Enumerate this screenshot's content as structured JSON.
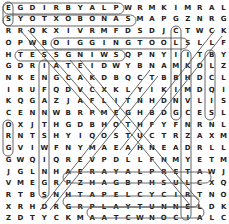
{
  "puzzle": {
    "type": "word-search",
    "rows": 19,
    "cols": 19,
    "grid": [
      "EGDIRBYALPWRMKIMRAL",
      "SYOTXOBONASMAPGZNRG",
      "RROKXIVRMFDSDJCTWCK",
      "OPWBOIGGINGTOOLSLLF",
      "HTESSGNIWSQPNYIITBY",
      "GDRIATEIDWYBNAMKOLZ",
      "NKENGCAKDBQCTBBHDCL",
      "IRUFQDVCXKLYIKIMDQI",
      "KQGAZJAFLITNHDNVLIS",
      "CENNWBRPMEGHBDGCESL",
      "OXJTHGDBHOTHFYFNRNL",
      "RNTSHYIQOSTUCTRZAXM",
      "GVIWFNYMAEAHNEADRLL",
      "GWQIQREVPDLLFNMYETM",
      "JGLNHAERAYALPRETAWJ",
      "VMEGRPZHAGBPHSULCXQ",
      "RTBSNHTAPELCYCIRTNO",
      "XRHDRGRPLAYTUNNELDK",
      "ZDTYCKMAATCWNOCIALC"
    ],
    "found_words": [
      {
        "word": "PLAYBRIDGE",
        "from": [
          0,
          9
        ],
        "to": [
          0,
          0
        ]
      },
      {
        "word": "SANOBOXTOYS",
        "from": [
          1,
          10
        ],
        "to": [
          1,
          0
        ]
      },
      {
        "word": "SWINGSSET",
        "from": [
          4,
          9
        ],
        "to": [
          4,
          1
        ]
      },
      {
        "word": "DIGGINGTOOLS",
        "from": [
          3,
          4
        ],
        "to": [
          3,
          15
        ]
      },
      {
        "word": "WATERPLAYAREA",
        "from": [
          14,
          17
        ],
        "to": [
          14,
          5
        ]
      },
      {
        "word": "TRICYCLEPATH",
        "from": [
          16,
          16
        ],
        "to": [
          16,
          5
        ]
      },
      {
        "word": "PLAYTUNNEL",
        "from": [
          17,
          7
        ],
        "to": [
          17,
          16
        ]
      }
    ],
    "colors": {
      "text": "#222222",
      "outline": "#555555",
      "background": "#ffffff"
    }
  }
}
